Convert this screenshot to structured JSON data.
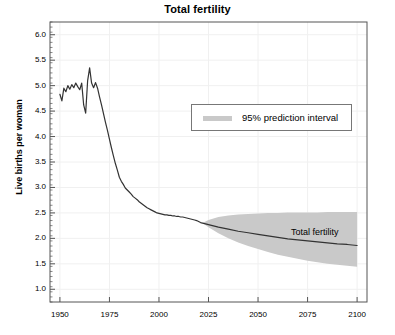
{
  "chart_data": {
    "type": "line",
    "title": "Total fertility",
    "xlabel": "",
    "ylabel": "Live births per woman",
    "xlim": [
      1945,
      2105
    ],
    "ylim": [
      0.75,
      6.25
    ],
    "xticks": [
      1950,
      1975,
      2000,
      2025,
      2050,
      2075,
      2100
    ],
    "xtick_labels": [
      "1950",
      "1975",
      "2000",
      "2025",
      "2050",
      "2075",
      "2100"
    ],
    "yticks": [
      1.0,
      1.5,
      2.0,
      2.5,
      3.0,
      3.5,
      4.0,
      4.5,
      5.0,
      5.5,
      6.0
    ],
    "ytick_labels": [
      "1.0",
      "1.5",
      "2.0",
      "2.5",
      "3.0",
      "3.5",
      "4.0",
      "4.5",
      "5.0",
      "5.5",
      "6.0"
    ],
    "grid": true,
    "grid_color": "#f0f0f0",
    "minor_ticks": true,
    "legend": {
      "position": "upper-center",
      "entries": [
        {
          "label": "95% prediction interval",
          "color": "#c9c9c9",
          "type": "band"
        }
      ]
    },
    "annotations": [
      {
        "text": "Total fertility",
        "x": 2062,
        "y": 2.05
      }
    ],
    "series": [
      {
        "name": "Total fertility",
        "type": "line",
        "color": "#333333",
        "x": [
          1950,
          1951,
          1952,
          1953,
          1954,
          1955,
          1956,
          1957,
          1958,
          1959,
          1960,
          1961,
          1962,
          1963,
          1964,
          1965,
          1966,
          1967,
          1968,
          1969,
          1970,
          1971,
          1972,
          1973,
          1974,
          1975,
          1976,
          1977,
          1978,
          1979,
          1980,
          1981,
          1982,
          1983,
          1984,
          1985,
          1986,
          1987,
          1988,
          1989,
          1990,
          1991,
          1992,
          1993,
          1994,
          1995,
          1996,
          1997,
          1998,
          1999,
          2000,
          2001,
          2002,
          2003,
          2004,
          2005,
          2006,
          2007,
          2008,
          2009,
          2010,
          2011,
          2012,
          2013,
          2014,
          2015,
          2016,
          2017,
          2018,
          2019,
          2020,
          2021,
          2022,
          2025,
          2030,
          2035,
          2040,
          2045,
          2050,
          2055,
          2060,
          2065,
          2070,
          2075,
          2080,
          2085,
          2090,
          2095,
          2100
        ],
        "y": [
          4.83,
          4.7,
          4.95,
          4.88,
          5.0,
          4.93,
          5.02,
          4.96,
          5.05,
          4.98,
          4.92,
          5.05,
          4.62,
          4.46,
          5.1,
          5.35,
          5.05,
          4.96,
          5.06,
          4.95,
          4.78,
          4.62,
          4.45,
          4.28,
          4.12,
          3.95,
          3.78,
          3.62,
          3.47,
          3.34,
          3.2,
          3.12,
          3.06,
          2.99,
          2.95,
          2.91,
          2.87,
          2.82,
          2.79,
          2.76,
          2.72,
          2.69,
          2.66,
          2.63,
          2.6,
          2.58,
          2.56,
          2.54,
          2.52,
          2.5,
          2.49,
          2.48,
          2.47,
          2.46,
          2.46,
          2.45,
          2.45,
          2.44,
          2.44,
          2.43,
          2.43,
          2.42,
          2.42,
          2.41,
          2.4,
          2.39,
          2.38,
          2.37,
          2.36,
          2.35,
          2.33,
          2.31,
          2.3,
          2.27,
          2.22,
          2.18,
          2.14,
          2.11,
          2.08,
          2.05,
          2.02,
          1.99,
          1.97,
          1.95,
          1.93,
          1.91,
          1.89,
          1.88,
          1.86
        ]
      }
    ],
    "band": {
      "name": "95% prediction interval",
      "color": "#c9c9c9",
      "x": [
        2022,
        2025,
        2030,
        2035,
        2040,
        2045,
        2050,
        2055,
        2060,
        2065,
        2070,
        2075,
        2080,
        2085,
        2090,
        2095,
        2100
      ],
      "lower": [
        2.3,
        2.22,
        2.1,
        2.0,
        1.92,
        1.85,
        1.79,
        1.73,
        1.68,
        1.64,
        1.6,
        1.56,
        1.53,
        1.5,
        1.48,
        1.46,
        1.44
      ],
      "upper": [
        2.3,
        2.36,
        2.42,
        2.45,
        2.47,
        2.48,
        2.49,
        2.5,
        2.5,
        2.51,
        2.51,
        2.51,
        2.51,
        2.52,
        2.52,
        2.52,
        2.52
      ]
    }
  }
}
